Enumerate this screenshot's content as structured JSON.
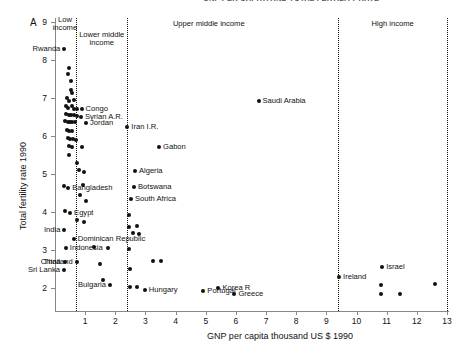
{
  "figure": {
    "panel_letter": "A",
    "clipped_header": "GNP PER CAPITA AND TOTAL FERTILITY RATE"
  },
  "chart_data": {
    "type": "scatter",
    "title": "",
    "xlabel": "GNP per capita thousand US $ 1990",
    "ylabel": "Total fertility rate 1990",
    "xlim": [
      0,
      13
    ],
    "ylim": [
      1.5,
      9.2
    ],
    "xticks": [
      1,
      2,
      3,
      4,
      5,
      6,
      7,
      8,
      9,
      10,
      11,
      12,
      13
    ],
    "yticks": [
      2,
      3,
      4,
      5,
      6,
      7,
      8,
      9
    ],
    "grid": false,
    "legend": "none",
    "bands": [
      {
        "name": "low-income",
        "label": "Low\nincome",
        "x_start": 0.0,
        "x_end": 0.7,
        "label_x": 0.33,
        "label_y": 9.0
      },
      {
        "name": "lower-middle-income",
        "label": "Lower middle\nincome",
        "x_start": 0.7,
        "x_end": 2.4,
        "label_x": 1.55,
        "label_y": 8.6
      },
      {
        "name": "upper-middle-income",
        "label": "Upper middle income",
        "x_start": 2.4,
        "x_end": 9.4,
        "label_x": 5.1,
        "label_y": 8.9
      },
      {
        "name": "high-income",
        "label": "High income",
        "x_start": 9.4,
        "x_end": 13.0,
        "label_x": 11.2,
        "label_y": 8.9
      }
    ],
    "band_dividers": [
      0.7,
      2.4,
      9.4,
      13.0
    ],
    "points": [
      {
        "x": 0.31,
        "y": 8.3,
        "label": "Rwanda",
        "side": "left"
      },
      {
        "x": 0.48,
        "y": 7.8,
        "label": "",
        "side": ""
      },
      {
        "x": 0.44,
        "y": 7.63,
        "label": "",
        "side": ""
      },
      {
        "x": 0.53,
        "y": 7.45,
        "label": "",
        "side": ""
      },
      {
        "x": 0.52,
        "y": 7.2,
        "label": "",
        "side": ""
      },
      {
        "x": 0.58,
        "y": 7.12,
        "label": "",
        "side": ""
      },
      {
        "x": 0.41,
        "y": 7.0,
        "label": "",
        "side": ""
      },
      {
        "x": 0.47,
        "y": 6.93,
        "label": "",
        "side": ""
      },
      {
        "x": 0.62,
        "y": 6.95,
        "label": "",
        "side": ""
      },
      {
        "x": 0.36,
        "y": 6.78,
        "label": "",
        "side": ""
      },
      {
        "x": 0.44,
        "y": 6.74,
        "label": "",
        "side": ""
      },
      {
        "x": 0.55,
        "y": 6.8,
        "label": "",
        "side": ""
      },
      {
        "x": 0.64,
        "y": 6.72,
        "label": "",
        "side": ""
      },
      {
        "x": 0.74,
        "y": 6.72,
        "label": "",
        "side": ""
      },
      {
        "x": 0.88,
        "y": 6.72,
        "label": "Congo",
        "side": "right"
      },
      {
        "x": 0.38,
        "y": 6.58,
        "label": "",
        "side": ""
      },
      {
        "x": 0.46,
        "y": 6.55,
        "label": "",
        "side": ""
      },
      {
        "x": 0.53,
        "y": 6.55,
        "label": "",
        "side": ""
      },
      {
        "x": 0.62,
        "y": 6.55,
        "label": "",
        "side": ""
      },
      {
        "x": 0.72,
        "y": 6.53,
        "label": "",
        "side": ""
      },
      {
        "x": 0.86,
        "y": 6.5,
        "label": "Syrian A.R.",
        "side": "right"
      },
      {
        "x": 0.34,
        "y": 6.4,
        "label": "",
        "side": ""
      },
      {
        "x": 0.42,
        "y": 6.38,
        "label": "",
        "side": ""
      },
      {
        "x": 0.5,
        "y": 6.38,
        "label": "",
        "side": ""
      },
      {
        "x": 0.58,
        "y": 6.36,
        "label": "",
        "side": ""
      },
      {
        "x": 0.66,
        "y": 6.36,
        "label": "",
        "side": ""
      },
      {
        "x": 1.03,
        "y": 6.33,
        "label": "Jordan",
        "side": "right"
      },
      {
        "x": 2.4,
        "y": 6.25,
        "label": "Iran I.R.",
        "side": "right"
      },
      {
        "x": 0.4,
        "y": 6.15,
        "label": "",
        "side": ""
      },
      {
        "x": 0.48,
        "y": 6.12,
        "label": "",
        "side": ""
      },
      {
        "x": 0.56,
        "y": 6.12,
        "label": "",
        "side": ""
      },
      {
        "x": 0.42,
        "y": 5.95,
        "label": "",
        "side": ""
      },
      {
        "x": 0.5,
        "y": 5.93,
        "label": "",
        "side": ""
      },
      {
        "x": 0.6,
        "y": 5.93,
        "label": "",
        "side": ""
      },
      {
        "x": 0.7,
        "y": 5.9,
        "label": "",
        "side": ""
      },
      {
        "x": 0.46,
        "y": 5.73,
        "label": "",
        "side": ""
      },
      {
        "x": 0.57,
        "y": 5.7,
        "label": "",
        "side": ""
      },
      {
        "x": 0.88,
        "y": 5.72,
        "label": "",
        "side": ""
      },
      {
        "x": 3.45,
        "y": 5.72,
        "label": "Gabon",
        "side": "right"
      },
      {
        "x": 0.48,
        "y": 5.5,
        "label": "",
        "side": ""
      },
      {
        "x": 0.72,
        "y": 5.3,
        "label": "",
        "side": ""
      },
      {
        "x": 0.78,
        "y": 5.1,
        "label": "",
        "side": ""
      },
      {
        "x": 2.65,
        "y": 5.08,
        "label": "Algeria",
        "side": "right"
      },
      {
        "x": 0.97,
        "y": 5.05,
        "label": "",
        "side": ""
      },
      {
        "x": 0.3,
        "y": 4.68,
        "label": "",
        "side": ""
      },
      {
        "x": 0.44,
        "y": 4.63,
        "label": "Bangladesh",
        "side": "right"
      },
      {
        "x": 0.92,
        "y": 4.7,
        "label": "",
        "side": ""
      },
      {
        "x": 2.62,
        "y": 4.66,
        "label": "Botswana",
        "side": "right"
      },
      {
        "x": 0.82,
        "y": 4.45,
        "label": "",
        "side": ""
      },
      {
        "x": 2.52,
        "y": 4.35,
        "label": "South Africa",
        "side": "right"
      },
      {
        "x": 1.02,
        "y": 4.3,
        "label": "",
        "side": ""
      },
      {
        "x": 0.33,
        "y": 4.02,
        "label": "",
        "side": ""
      },
      {
        "x": 0.5,
        "y": 3.98,
        "label": "Egypt",
        "side": "right"
      },
      {
        "x": 2.46,
        "y": 3.93,
        "label": "",
        "side": ""
      },
      {
        "x": 0.72,
        "y": 3.78,
        "label": "",
        "side": ""
      },
      {
        "x": 0.95,
        "y": 3.75,
        "label": "",
        "side": ""
      },
      {
        "x": 2.45,
        "y": 3.6,
        "label": "",
        "side": ""
      },
      {
        "x": 2.72,
        "y": 3.62,
        "label": "",
        "side": ""
      },
      {
        "x": 0.31,
        "y": 3.52,
        "label": "India",
        "side": "left"
      },
      {
        "x": 2.58,
        "y": 3.45,
        "label": "",
        "side": ""
      },
      {
        "x": 2.78,
        "y": 3.43,
        "label": "",
        "side": ""
      },
      {
        "x": 0.62,
        "y": 3.3,
        "label": "Dominican Republic",
        "side": "right"
      },
      {
        "x": 0.36,
        "y": 3.05,
        "label": "Indonesia",
        "side": "right"
      },
      {
        "x": 1.3,
        "y": 3.08,
        "label": "",
        "side": ""
      },
      {
        "x": 1.75,
        "y": 3.05,
        "label": "",
        "side": ""
      },
      {
        "x": 2.44,
        "y": 3.02,
        "label": "",
        "side": ""
      },
      {
        "x": 0.32,
        "y": 2.68,
        "label": "China",
        "side": "left"
      },
      {
        "x": 0.72,
        "y": 2.68,
        "label": "Thailand",
        "side": "left"
      },
      {
        "x": 1.5,
        "y": 2.63,
        "label": "",
        "side": ""
      },
      {
        "x": 3.25,
        "y": 2.72,
        "label": "",
        "side": ""
      },
      {
        "x": 3.5,
        "y": 2.72,
        "label": "",
        "side": ""
      },
      {
        "x": 0.3,
        "y": 2.48,
        "label": "Sri Lanka",
        "side": "left"
      },
      {
        "x": 2.48,
        "y": 2.5,
        "label": "",
        "side": ""
      },
      {
        "x": 1.6,
        "y": 2.22,
        "label": "",
        "side": ""
      },
      {
        "x": 9.42,
        "y": 2.28,
        "label": "Ireland",
        "side": "right"
      },
      {
        "x": 1.82,
        "y": 2.08,
        "label": "Bulgaria",
        "side": "left"
      },
      {
        "x": 2.5,
        "y": 2.02,
        "label": "",
        "side": ""
      },
      {
        "x": 2.72,
        "y": 2.02,
        "label": "",
        "side": ""
      },
      {
        "x": 2.98,
        "y": 1.95,
        "label": "Hungary",
        "side": "right"
      },
      {
        "x": 5.42,
        "y": 2.0,
        "label": "Korea R",
        "side": "right"
      },
      {
        "x": 4.92,
        "y": 1.92,
        "label": "Portugal",
        "side": "right"
      },
      {
        "x": 5.95,
        "y": 1.85,
        "label": "Greece",
        "side": "right"
      },
      {
        "x": 6.75,
        "y": 6.93,
        "label": "Saudi Arabia",
        "side": "right"
      },
      {
        "x": 10.85,
        "y": 2.55,
        "label": "Israel",
        "side": "right"
      },
      {
        "x": 10.82,
        "y": 2.08,
        "label": "",
        "side": ""
      },
      {
        "x": 10.82,
        "y": 1.83,
        "label": "",
        "side": ""
      },
      {
        "x": 11.45,
        "y": 1.83,
        "label": "",
        "side": ""
      },
      {
        "x": 12.6,
        "y": 2.1,
        "label": "",
        "side": ""
      }
    ]
  }
}
